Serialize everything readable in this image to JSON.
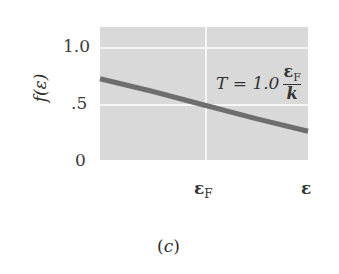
{
  "chart_data": {
    "type": "line",
    "title": "",
    "xlabel": "",
    "ylabel": "f(ε)",
    "x_tick_labels": [
      "ε_F",
      "ε"
    ],
    "y_tick_labels": [
      "0",
      ".5",
      "1.0"
    ],
    "y_ticks": [
      0,
      0.5,
      1.0
    ],
    "ylim": [
      0,
      1.15
    ],
    "xlim": [
      0,
      2.0
    ],
    "grid": true,
    "annotation": "T = 1.0 ε_F / k",
    "caption": "(c)",
    "series": [
      {
        "name": "Fermi-Dirac distribution, T = 1.0 ε_F/k",
        "x": [
          0,
          0.5,
          1.0,
          1.5,
          2.0
        ],
        "values": [
          0.73,
          0.62,
          0.5,
          0.38,
          0.27
        ]
      }
    ],
    "colors": {
      "plot_bg": "#d9d9d9",
      "grid": "#ffffff",
      "line": "#6e6e6e"
    }
  },
  "labels": {
    "y_axis": "f(ε)",
    "y_tick_1": "1.0",
    "y_tick_05": ".5",
    "y_tick_0": "0",
    "x_tick_ef_main": "ε",
    "x_tick_ef_sub": "F",
    "x_tick_e": "ε",
    "annot_lhs": "T = 1.0",
    "annot_num_main": "ε",
    "annot_num_sub": "F",
    "annot_den": "k",
    "caption_open": "(",
    "caption_letter": "c",
    "caption_close": ")"
  }
}
